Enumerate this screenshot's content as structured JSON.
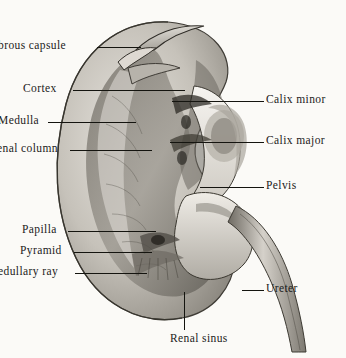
{
  "figure": {
    "background_color": "#fbfaf7",
    "line_color": "#14140f",
    "text_color": "#1b1b1b",
    "width": 346,
    "height": 358
  },
  "labels": {
    "fibrous_capsule": "brous capsule",
    "cortex": "Cortex",
    "medulla": "Medulla",
    "renal_column": "enal column",
    "papilla": "Papilla",
    "pyramid": "Pyramid",
    "medullary_ray": "edullary ray",
    "calix_minor": "Calix minor",
    "calix_major": "Calix major",
    "pelvis": "Pelvis",
    "ureter": "Ureter",
    "renal_sinus": "Renal sinus"
  },
  "structures": {
    "cortex_tone": "#c9c6bf",
    "medulla_tone": "#8d8981",
    "sinus_tone": "#f0eee9",
    "ureter_tone": "#b9b5ac",
    "outline_tone": "#4a463f"
  }
}
